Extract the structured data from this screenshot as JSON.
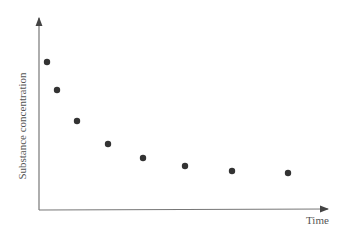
{
  "chart_data": {
    "type": "scatter",
    "title": "",
    "xlabel": "Time",
    "ylabel": "Substance concentration",
    "grid": false,
    "legend": null,
    "x_ticks": [],
    "y_ticks": [],
    "points": [
      {
        "x": 1,
        "y": 7.7
      },
      {
        "x": 1.6,
        "y": 6.2
      },
      {
        "x": 2.8,
        "y": 4.6
      },
      {
        "x": 4.6,
        "y": 3.4
      },
      {
        "x": 6.7,
        "y": 2.7
      },
      {
        "x": 9.2,
        "y": 2.3
      },
      {
        "x": 12.0,
        "y": 2.0
      },
      {
        "x": 15.3,
        "y": 1.9
      }
    ],
    "pixel_points": [
      [
        47,
        62
      ],
      [
        57,
        90
      ],
      [
        77,
        121
      ],
      [
        108,
        144
      ],
      [
        143,
        158
      ],
      [
        185,
        166
      ],
      [
        232,
        171
      ],
      [
        288,
        173
      ]
    ],
    "colors": {
      "axis": "#666666",
      "point": "#333333"
    }
  }
}
